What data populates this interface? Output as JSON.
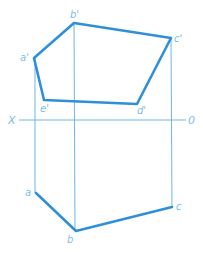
{
  "diagram": {
    "colors": {
      "thin_line": "#6fb6e6",
      "thick_line": "#2f8fd8",
      "label": "#7fbde8"
    },
    "axis": {
      "left_label": "X",
      "right_label": "0"
    },
    "front_view": {
      "points": [
        {
          "id": "a1",
          "label": "a'"
        },
        {
          "id": "b1",
          "label": "b'"
        },
        {
          "id": "c1",
          "label": "c'"
        },
        {
          "id": "d1",
          "label": "d'"
        },
        {
          "id": "e1",
          "label": "e'"
        }
      ]
    },
    "top_view": {
      "points": [
        {
          "id": "a",
          "label": "a"
        },
        {
          "id": "b",
          "label": "b"
        },
        {
          "id": "c",
          "label": "c"
        }
      ]
    }
  }
}
